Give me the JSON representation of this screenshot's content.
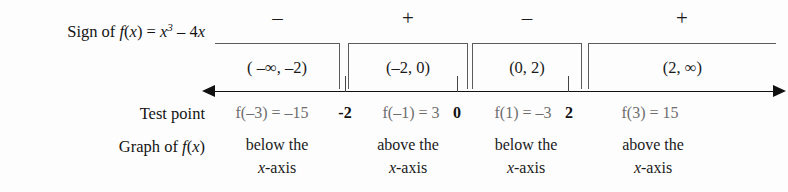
{
  "chart_data": {
    "type": "table",
    "function": "f(x) = x^3 - 4x",
    "axis": {
      "ticks": [
        "-2",
        "0",
        "2"
      ],
      "left_arrow": true,
      "right_arrow": true
    },
    "row_labels": {
      "sign": "Sign of f(x) = x",
      "sign_exponent": "3",
      "sign_tail": " – 4x",
      "test_point": "Test point",
      "graph": "Graph of f(x)"
    },
    "intervals": [
      {
        "notation": "( –∞, –2)",
        "sign": "–",
        "test_point": "f(–3) = –15",
        "graph_line1": "below the",
        "graph_line2": "x-axis"
      },
      {
        "notation": "(–2, 0)",
        "sign": "+",
        "test_point": "f(–1) = 3",
        "graph_line1": "above the",
        "graph_line2": "x-axis"
      },
      {
        "notation": "(0, 2)",
        "sign": "–",
        "test_point": "f(1) = –3",
        "graph_line1": "below the",
        "graph_line2": "x-axis"
      },
      {
        "notation": "(2, ∞)",
        "sign": "+",
        "test_point": "f(3) = 15",
        "graph_line1": "above the",
        "graph_line2": "x-axis"
      }
    ],
    "colors": {
      "ink": "#1a1a1a",
      "muted": "#6e6e6e",
      "rule": "#5c5c5c",
      "background": "#fdfdfd"
    }
  },
  "layout": {
    "bracket_boxes": [
      {
        "left": 215,
        "width": 125
      },
      {
        "left": 348,
        "width": 120
      },
      {
        "left": 472,
        "width": 110
      },
      {
        "left": 588,
        "width": 188
      }
    ],
    "sign_cells": [
      {
        "left": 215,
        "width": 125
      },
      {
        "left": 348,
        "width": 120
      },
      {
        "left": 472,
        "width": 110
      },
      {
        "left": 588,
        "width": 188
      }
    ],
    "test_cells": [
      {
        "left": 208,
        "width": 128
      },
      {
        "left": 356,
        "width": 110
      },
      {
        "left": 470,
        "width": 106
      },
      {
        "left": 590,
        "width": 120
      }
    ],
    "graph_cells": [
      {
        "left": 213,
        "width": 128
      },
      {
        "left": 348,
        "width": 120
      },
      {
        "left": 470,
        "width": 112
      },
      {
        "left": 588,
        "width": 130
      }
    ],
    "ticks": [
      345,
      457,
      568
    ],
    "tick_labels": [
      {
        "left": 328,
        "width": 34
      },
      {
        "left": 442,
        "width": 30
      },
      {
        "left": 554,
        "width": 30
      }
    ]
  }
}
